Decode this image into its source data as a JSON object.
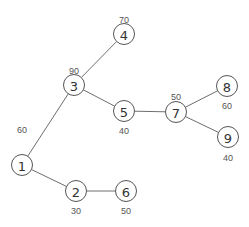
{
  "diagram": {
    "type": "tree",
    "nodes": [
      {
        "id": "1",
        "label": "1",
        "value": "60",
        "x": 22,
        "y": 165,
        "vx": 22,
        "vy": 130
      },
      {
        "id": "2",
        "label": "2",
        "value": "30",
        "x": 76,
        "y": 191,
        "vx": 76,
        "vy": 211
      },
      {
        "id": "3",
        "label": "3",
        "value": "90",
        "x": 74,
        "y": 85,
        "vx": 74,
        "vy": 71
      },
      {
        "id": "4",
        "label": "4",
        "value": "70",
        "x": 124,
        "y": 34,
        "vx": 124,
        "vy": 20
      },
      {
        "id": "5",
        "label": "5",
        "value": "40",
        "x": 124,
        "y": 111,
        "vx": 124,
        "vy": 131
      },
      {
        "id": "6",
        "label": "6",
        "value": "50",
        "x": 126,
        "y": 191,
        "vx": 126,
        "vy": 211
      },
      {
        "id": "7",
        "label": "7",
        "value": "50",
        "x": 176,
        "y": 112,
        "vx": 176,
        "vy": 97
      },
      {
        "id": "8",
        "label": "8",
        "value": "60",
        "x": 227,
        "y": 86,
        "vx": 227,
        "vy": 106
      },
      {
        "id": "9",
        "label": "9",
        "value": "40",
        "x": 228,
        "y": 137,
        "vx": 228,
        "vy": 158
      }
    ],
    "edges": [
      [
        "1",
        "3"
      ],
      [
        "3",
        "4"
      ],
      [
        "3",
        "5"
      ],
      [
        "5",
        "7"
      ],
      [
        "7",
        "8"
      ],
      [
        "7",
        "9"
      ],
      [
        "1",
        "2"
      ],
      [
        "2",
        "6"
      ]
    ]
  }
}
